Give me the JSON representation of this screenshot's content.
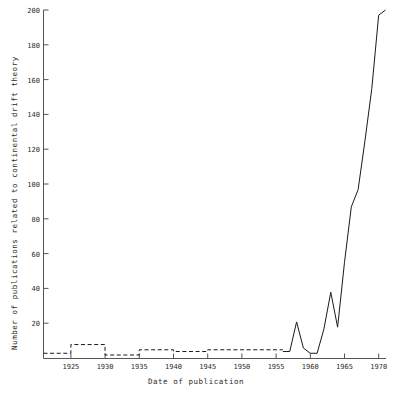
{
  "chart_data": {
    "type": "line",
    "title": "",
    "xlabel": "Date of publication",
    "ylabel": "Number of publications related to continental drift theory",
    "xlim": [
      1921,
      1971
    ],
    "ylim": [
      0,
      200
    ],
    "grid": false,
    "legend": null,
    "xticks": [
      1925,
      1930,
      1935,
      1940,
      1945,
      1950,
      1955,
      1960,
      1965,
      1970
    ],
    "xtick_labels": [
      "1925",
      "1930",
      "1935",
      "1940",
      "1945",
      "1950",
      "1955",
      "1960",
      "1965",
      "1970"
    ],
    "yticks": [
      0,
      20,
      40,
      60,
      80,
      100,
      120,
      140,
      160,
      180,
      200
    ],
    "ytick_labels": [
      "",
      "20",
      "40",
      "60",
      "80",
      "100",
      "120",
      "140",
      "160",
      "180",
      "200"
    ],
    "line_color": "#1a1a1a",
    "axis_color": "#555555",
    "series": [
      {
        "name": "early-period-step",
        "style": "dashed",
        "draw": "step",
        "x": [
          1921,
          1925,
          1930,
          1935,
          1940,
          1945,
          1950,
          1956
        ],
        "values": [
          3,
          8,
          2,
          5,
          4,
          5,
          5,
          5
        ]
      },
      {
        "name": "modern-period",
        "style": "solid",
        "draw": "line",
        "x": [
          1956,
          1957,
          1958,
          1959,
          1960,
          1961,
          1962,
          1963,
          1964,
          1965,
          1966,
          1967,
          1968,
          1969,
          1970,
          1971
        ],
        "values": [
          4,
          4,
          21,
          6,
          3,
          3,
          17,
          38,
          18,
          55,
          87,
          97,
          125,
          155,
          197,
          200
        ]
      }
    ]
  },
  "axes": {
    "x_title": "Date of publication",
    "y_title": "Number of publications related to continental drift theory"
  }
}
